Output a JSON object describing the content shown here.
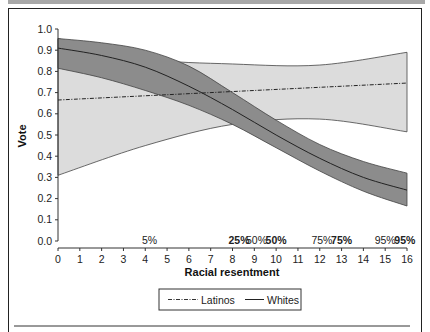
{
  "chart_data": {
    "type": "line",
    "title": "",
    "xlabel": "Racial resentment",
    "ylabel": "Vote",
    "xlim": [
      0,
      16
    ],
    "ylim": [
      0.0,
      1.0
    ],
    "x_ticks": [
      0,
      1,
      2,
      3,
      4,
      5,
      6,
      7,
      8,
      9,
      10,
      11,
      12,
      13,
      14,
      15,
      16
    ],
    "y_ticks": [
      "0.0",
      "0.1",
      "0.2",
      "0.3",
      "0.4",
      "0.5",
      "0.6",
      "0.7",
      "0.8",
      "0.9",
      "1.0"
    ],
    "grid": false,
    "legend_position": "bottom-center",
    "series": [
      {
        "name": "Latinos",
        "style": "dash-dot",
        "x": [
          0,
          4,
          8,
          12,
          16
        ],
        "values": [
          0.665,
          0.685,
          0.705,
          0.725,
          0.745
        ],
        "ci_lower": [
          0.31,
          0.45,
          0.55,
          0.575,
          0.515
        ],
        "ci_upper": [
          0.955,
          0.86,
          0.835,
          0.83,
          0.89
        ],
        "ci_color": "#dcdcdc"
      },
      {
        "name": "Whites",
        "style": "solid",
        "x": [
          0,
          2,
          4,
          6,
          8,
          10,
          12,
          14,
          16
        ],
        "values": [
          0.91,
          0.875,
          0.82,
          0.73,
          0.62,
          0.5,
          0.39,
          0.3,
          0.24
        ],
        "ci_lower": [
          0.815,
          0.77,
          0.71,
          0.64,
          0.55,
          0.44,
          0.33,
          0.235,
          0.165
        ],
        "ci_upper": [
          0.955,
          0.935,
          0.9,
          0.825,
          0.7,
          0.57,
          0.455,
          0.375,
          0.32
        ],
        "ci_color": "#8c8c8c"
      }
    ],
    "annotations": [
      {
        "text": "5%",
        "x": 4.2,
        "bold": false
      },
      {
        "text": "25%",
        "x": 8.3,
        "bold": true
      },
      {
        "text": "50%",
        "x": 9.1,
        "bold": false
      },
      {
        "text": "50%",
        "x": 10.0,
        "bold": true
      },
      {
        "text": "75%",
        "x": 12.1,
        "bold": false
      },
      {
        "text": "75%",
        "x": 13.0,
        "bold": true
      },
      {
        "text": "95%",
        "x": 15.0,
        "bold": false
      },
      {
        "text": "95%",
        "x": 15.9,
        "bold": true
      }
    ]
  },
  "legend": {
    "latinos_label": "Latinos",
    "whites_label": "Whites"
  },
  "axes": {
    "xlabel": "Racial resentment",
    "ylabel": "Vote"
  }
}
